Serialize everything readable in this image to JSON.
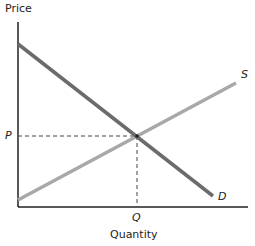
{
  "diagram": {
    "type": "supply-demand",
    "y_axis_label": "Price",
    "x_axis_label": "Quantity",
    "supply_label": "S",
    "demand_label": "D",
    "equilibrium_price_label": "P",
    "equilibrium_quantity_label": "Q",
    "colors": {
      "demand": "#6b6b6b",
      "supply": "#a8a8a8",
      "axis": "#222222",
      "guide": "#444444"
    }
  }
}
